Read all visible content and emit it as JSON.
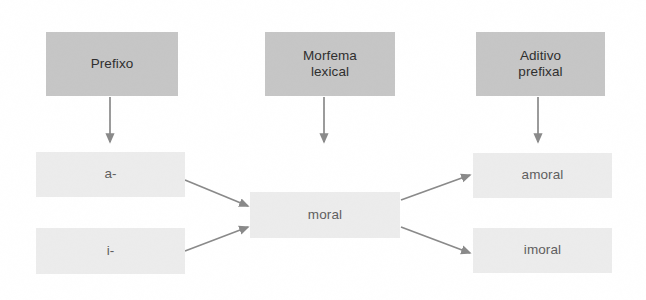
{
  "diagram": {
    "colors": {
      "header_fill": "#c6c6c6",
      "token_fill": "#ececec",
      "header_text": "#2f2f2f",
      "token_text": "#5f5f5f",
      "arrow": "#8a8a8a",
      "background": "#ffffff"
    },
    "headers": [
      {
        "id": "prefixo",
        "label": "Prefixo",
        "x": 46,
        "y": 32,
        "w": 132,
        "h": 64
      },
      {
        "id": "morfema-lexical",
        "label": "Morfema\nlexical",
        "x": 265,
        "y": 32,
        "w": 130,
        "h": 64
      },
      {
        "id": "aditivo-prefixal",
        "label": "Aditivo\nprefixal",
        "x": 476,
        "y": 32,
        "w": 129,
        "h": 64
      }
    ],
    "prefixes": [
      {
        "id": "a-",
        "label": "a-",
        "x": 36,
        "y": 152,
        "w": 149,
        "h": 45
      },
      {
        "id": "i-",
        "label": "i-",
        "x": 36,
        "y": 228,
        "w": 149,
        "h": 46
      }
    ],
    "base": {
      "id": "moral",
      "label": "moral",
      "x": 250,
      "y": 192,
      "w": 150,
      "h": 46
    },
    "results": [
      {
        "id": "amoral",
        "label": "amoral",
        "x": 473,
        "y": 153,
        "w": 139,
        "h": 45
      },
      {
        "id": "imoral",
        "label": "imoral",
        "x": 473,
        "y": 228,
        "w": 139,
        "h": 45
      }
    ],
    "connectors": [
      {
        "id": "arrow-prefixo-down",
        "kind": "vertical",
        "from": [
          110,
          97
        ],
        "to": [
          110,
          142
        ]
      },
      {
        "id": "arrow-morfema-down",
        "kind": "vertical",
        "from": [
          324,
          97
        ],
        "to": [
          324,
          142
        ]
      },
      {
        "id": "arrow-aditivo-down",
        "kind": "vertical",
        "from": [
          538,
          97
        ],
        "to": [
          538,
          142
        ]
      },
      {
        "id": "arrow-a-to-moral",
        "kind": "diagonal",
        "from": [
          185,
          180
        ],
        "to": [
          248,
          206
        ]
      },
      {
        "id": "arrow-i-to-moral",
        "kind": "diagonal",
        "from": [
          185,
          251
        ],
        "to": [
          248,
          227
        ]
      },
      {
        "id": "arrow-moral-to-amoral",
        "kind": "diagonal",
        "from": [
          401,
          200
        ],
        "to": [
          470,
          175
        ]
      },
      {
        "id": "arrow-moral-to-imoral",
        "kind": "diagonal",
        "from": [
          401,
          227
        ],
        "to": [
          470,
          253
        ]
      }
    ]
  }
}
